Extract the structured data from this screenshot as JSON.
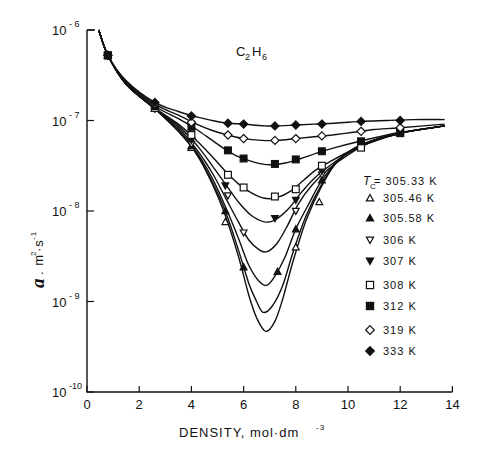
{
  "chart_data": {
    "type": "line",
    "annotation": {
      "main": "C",
      "sub1": "2",
      "mid": "H",
      "sub2": "6"
    },
    "xlabel": "DENSITY, mol·dm",
    "xlabel_exp": "-3",
    "ylabel": "a",
    "ylabel_units": ". m",
    "ylabel_units_exp": "2",
    "ylabel_units2": "·s",
    "ylabel_units2_exp": "-1",
    "xlim": [
      0,
      14
    ],
    "ylim_log10": [
      -10,
      -6
    ],
    "yscale": "log",
    "grid": false,
    "x_ticks": [
      0,
      2,
      4,
      6,
      8,
      10,
      12,
      14
    ],
    "x_tick_labels": [
      "0",
      "2",
      "4",
      "6",
      "8",
      "10",
      "12",
      "14"
    ],
    "y_ticks_log10": [
      -6,
      -7,
      -8,
      -9,
      -10
    ],
    "y_tick_labels": [
      {
        "base": "10",
        "exp": "- 6"
      },
      {
        "base": "10",
        "exp": "- 7"
      },
      {
        "base": "10",
        "exp": "- 8"
      },
      {
        "base": "10",
        "exp": "- 9"
      },
      {
        "base": "10",
        "exp": "-10"
      }
    ],
    "legend": {
      "position": "right",
      "title_sym": "T",
      "title_sub": "C",
      "title_value": " = 305.33 K"
    },
    "series": [
      {
        "name": "305.33 K",
        "marker": "none",
        "curve": [
          [
            0.45,
            -6.0
          ],
          [
            0.8,
            -6.28
          ],
          [
            1.5,
            -6.6
          ],
          [
            2.6,
            -6.87
          ],
          [
            3.5,
            -7.12
          ],
          [
            4.2,
            -7.37
          ],
          [
            4.8,
            -7.7
          ],
          [
            5.3,
            -8.05
          ],
          [
            5.8,
            -8.5
          ],
          [
            6.2,
            -8.93
          ],
          [
            6.5,
            -9.18
          ],
          [
            6.85,
            -9.33
          ],
          [
            7.2,
            -9.22
          ],
          [
            7.5,
            -8.97
          ],
          [
            7.9,
            -8.55
          ],
          [
            8.4,
            -8.1
          ],
          [
            9.0,
            -7.72
          ],
          [
            9.6,
            -7.45
          ],
          [
            10.5,
            -7.27
          ],
          [
            12.0,
            -7.14
          ],
          [
            13.7,
            -7.06
          ]
        ],
        "points": []
      },
      {
        "name": "305.46 K",
        "marker": "triangle-open",
        "curve": [
          [
            0.45,
            -6.0
          ],
          [
            0.8,
            -6.28
          ],
          [
            1.5,
            -6.6
          ],
          [
            2.6,
            -6.87
          ],
          [
            3.5,
            -7.12
          ],
          [
            4.2,
            -7.37
          ],
          [
            4.8,
            -7.68
          ],
          [
            5.3,
            -8.0
          ],
          [
            5.8,
            -8.43
          ],
          [
            6.2,
            -8.8
          ],
          [
            6.5,
            -9.0
          ],
          [
            6.75,
            -9.12
          ],
          [
            7.1,
            -9.05
          ],
          [
            7.5,
            -8.82
          ],
          [
            7.9,
            -8.45
          ],
          [
            8.4,
            -8.05
          ],
          [
            9.0,
            -7.7
          ],
          [
            9.6,
            -7.45
          ],
          [
            10.5,
            -7.27
          ],
          [
            12.0,
            -7.14
          ],
          [
            13.7,
            -7.06
          ]
        ],
        "points": [
          [
            0.8,
            -6.28
          ],
          [
            2.6,
            -6.87
          ],
          [
            4.0,
            -7.3
          ],
          [
            5.3,
            -8.12
          ],
          [
            8.0,
            -8.4
          ],
          [
            8.9,
            -7.9
          ]
        ]
      },
      {
        "name": "305.58 K",
        "marker": "triangle-filled",
        "curve": [
          [
            0.45,
            -6.0
          ],
          [
            0.8,
            -6.28
          ],
          [
            1.5,
            -6.6
          ],
          [
            2.6,
            -6.87
          ],
          [
            3.5,
            -7.1
          ],
          [
            4.2,
            -7.35
          ],
          [
            4.8,
            -7.64
          ],
          [
            5.3,
            -7.95
          ],
          [
            5.8,
            -8.3
          ],
          [
            6.2,
            -8.6
          ],
          [
            6.6,
            -8.78
          ],
          [
            6.9,
            -8.82
          ],
          [
            7.2,
            -8.72
          ],
          [
            7.6,
            -8.5
          ],
          [
            8.0,
            -8.2
          ],
          [
            8.5,
            -7.92
          ],
          [
            9.0,
            -7.66
          ],
          [
            9.6,
            -7.45
          ],
          [
            10.5,
            -7.27
          ],
          [
            12.0,
            -7.14
          ],
          [
            13.7,
            -7.06
          ]
        ],
        "points": [
          [
            0.8,
            -6.28
          ],
          [
            2.6,
            -6.87
          ],
          [
            4.0,
            -7.28
          ],
          [
            5.3,
            -8.0
          ],
          [
            6.0,
            -8.62
          ],
          [
            7.3,
            -8.67
          ],
          [
            8.0,
            -8.2
          ],
          [
            9.0,
            -7.66
          ]
        ]
      },
      {
        "name": "306 K",
        "marker": "triangle-down-open",
        "curve": [
          [
            0.45,
            -6.0
          ],
          [
            0.8,
            -6.28
          ],
          [
            1.5,
            -6.6
          ],
          [
            2.6,
            -6.87
          ],
          [
            3.5,
            -7.08
          ],
          [
            4.2,
            -7.32
          ],
          [
            4.8,
            -7.58
          ],
          [
            5.3,
            -7.85
          ],
          [
            5.8,
            -8.12
          ],
          [
            6.2,
            -8.32
          ],
          [
            6.6,
            -8.43
          ],
          [
            6.9,
            -8.45
          ],
          [
            7.3,
            -8.35
          ],
          [
            7.7,
            -8.15
          ],
          [
            8.1,
            -7.92
          ],
          [
            8.6,
            -7.72
          ],
          [
            9.2,
            -7.55
          ],
          [
            10.0,
            -7.38
          ],
          [
            10.8,
            -7.25
          ],
          [
            12.0,
            -7.14
          ],
          [
            13.7,
            -7.06
          ]
        ],
        "points": [
          [
            0.8,
            -6.28
          ],
          [
            2.6,
            -6.87
          ],
          [
            4.0,
            -7.26
          ],
          [
            5.4,
            -7.83
          ],
          [
            6.0,
            -8.24
          ],
          [
            8.0,
            -8.0
          ],
          [
            9.0,
            -7.6
          ]
        ]
      },
      {
        "name": "307 K",
        "marker": "triangle-down-filled",
        "curve": [
          [
            0.45,
            -6.0
          ],
          [
            0.8,
            -6.28
          ],
          [
            1.5,
            -6.6
          ],
          [
            2.6,
            -6.87
          ],
          [
            3.5,
            -7.06
          ],
          [
            4.2,
            -7.27
          ],
          [
            4.8,
            -7.5
          ],
          [
            5.3,
            -7.7
          ],
          [
            5.8,
            -7.9
          ],
          [
            6.3,
            -8.05
          ],
          [
            6.8,
            -8.12
          ],
          [
            7.2,
            -8.1
          ],
          [
            7.7,
            -7.98
          ],
          [
            8.2,
            -7.8
          ],
          [
            8.7,
            -7.64
          ],
          [
            9.3,
            -7.5
          ],
          [
            10.0,
            -7.36
          ],
          [
            10.8,
            -7.25
          ],
          [
            12.0,
            -7.14
          ],
          [
            13.7,
            -7.06
          ]
        ],
        "points": [
          [
            0.8,
            -6.28
          ],
          [
            2.6,
            -6.87
          ],
          [
            4.0,
            -7.22
          ],
          [
            5.3,
            -7.72
          ],
          [
            7.2,
            -8.08
          ],
          [
            8.0,
            -7.88
          ],
          [
            9.0,
            -7.56
          ]
        ]
      },
      {
        "name": "308 K",
        "marker": "square-open",
        "curve": [
          [
            0.45,
            -6.0
          ],
          [
            0.8,
            -6.28
          ],
          [
            1.5,
            -6.6
          ],
          [
            2.6,
            -6.86
          ],
          [
            3.5,
            -7.04
          ],
          [
            4.2,
            -7.22
          ],
          [
            4.8,
            -7.4
          ],
          [
            5.3,
            -7.56
          ],
          [
            5.8,
            -7.7
          ],
          [
            6.3,
            -7.8
          ],
          [
            6.8,
            -7.86
          ],
          [
            7.3,
            -7.85
          ],
          [
            7.8,
            -7.78
          ],
          [
            8.3,
            -7.66
          ],
          [
            8.8,
            -7.54
          ],
          [
            9.4,
            -7.44
          ],
          [
            10.2,
            -7.32
          ],
          [
            11.0,
            -7.22
          ],
          [
            12.0,
            -7.14
          ],
          [
            13.7,
            -7.06
          ]
        ],
        "points": [
          [
            0.8,
            -6.28
          ],
          [
            2.6,
            -6.86
          ],
          [
            4.0,
            -7.16
          ],
          [
            5.4,
            -7.6
          ],
          [
            6.0,
            -7.74
          ],
          [
            7.2,
            -7.84
          ],
          [
            8.0,
            -7.76
          ],
          [
            9.0,
            -7.5
          ],
          [
            10.5,
            -7.3
          ],
          [
            12.0,
            -7.14
          ]
        ]
      },
      {
        "name": "312 K",
        "marker": "square-filled",
        "curve": [
          [
            0.45,
            -6.0
          ],
          [
            0.8,
            -6.28
          ],
          [
            1.5,
            -6.58
          ],
          [
            2.6,
            -6.84
          ],
          [
            3.5,
            -6.98
          ],
          [
            4.2,
            -7.1
          ],
          [
            4.8,
            -7.22
          ],
          [
            5.3,
            -7.32
          ],
          [
            5.8,
            -7.4
          ],
          [
            6.4,
            -7.46
          ],
          [
            7.0,
            -7.49
          ],
          [
            7.6,
            -7.47
          ],
          [
            8.2,
            -7.42
          ],
          [
            8.8,
            -7.36
          ],
          [
            9.5,
            -7.3
          ],
          [
            10.3,
            -7.24
          ],
          [
            11.2,
            -7.18
          ],
          [
            12.0,
            -7.13
          ],
          [
            13.7,
            -7.06
          ]
        ],
        "points": [
          [
            0.8,
            -6.28
          ],
          [
            2.6,
            -6.84
          ],
          [
            4.0,
            -7.07
          ],
          [
            5.4,
            -7.33
          ],
          [
            6.0,
            -7.42
          ],
          [
            7.2,
            -7.48
          ],
          [
            8.0,
            -7.43
          ],
          [
            9.0,
            -7.34
          ],
          [
            10.5,
            -7.23
          ],
          [
            12.0,
            -7.13
          ]
        ]
      },
      {
        "name": "319 K",
        "marker": "diamond-open",
        "curve": [
          [
            0.45,
            -6.0
          ],
          [
            0.8,
            -6.28
          ],
          [
            1.5,
            -6.57
          ],
          [
            2.6,
            -6.82
          ],
          [
            3.5,
            -6.94
          ],
          [
            4.2,
            -7.04
          ],
          [
            4.8,
            -7.11
          ],
          [
            5.4,
            -7.16
          ],
          [
            6.0,
            -7.2
          ],
          [
            6.7,
            -7.22
          ],
          [
            7.3,
            -7.22
          ],
          [
            8.0,
            -7.2
          ],
          [
            8.7,
            -7.18
          ],
          [
            9.4,
            -7.16
          ],
          [
            10.2,
            -7.13
          ],
          [
            11.0,
            -7.1
          ],
          [
            12.0,
            -7.08
          ],
          [
            13.7,
            -7.04
          ]
        ],
        "points": [
          [
            0.8,
            -6.28
          ],
          [
            2.6,
            -6.82
          ],
          [
            4.0,
            -7.02
          ],
          [
            5.4,
            -7.16
          ],
          [
            6.0,
            -7.2
          ],
          [
            7.2,
            -7.22
          ],
          [
            8.0,
            -7.2
          ],
          [
            9.0,
            -7.17
          ],
          [
            10.5,
            -7.12
          ],
          [
            12.0,
            -7.08
          ]
        ]
      },
      {
        "name": "333 K",
        "marker": "diamond-filled",
        "curve": [
          [
            0.45,
            -6.0
          ],
          [
            0.8,
            -6.28
          ],
          [
            1.5,
            -6.56
          ],
          [
            2.6,
            -6.8
          ],
          [
            3.5,
            -6.9
          ],
          [
            4.2,
            -6.96
          ],
          [
            4.8,
            -7.0
          ],
          [
            5.4,
            -7.03
          ],
          [
            6.0,
            -7.04
          ],
          [
            6.8,
            -7.06
          ],
          [
            7.4,
            -7.06
          ],
          [
            8.0,
            -7.05
          ],
          [
            8.7,
            -7.04
          ],
          [
            9.5,
            -7.03
          ],
          [
            10.5,
            -7.01
          ],
          [
            11.5,
            -7.0
          ],
          [
            12.5,
            -6.99
          ],
          [
            13.7,
            -6.99
          ]
        ],
        "points": [
          [
            0.8,
            -6.28
          ],
          [
            2.6,
            -6.8
          ],
          [
            4.0,
            -6.95
          ],
          [
            5.4,
            -7.03
          ],
          [
            6.0,
            -7.04
          ],
          [
            7.2,
            -7.06
          ],
          [
            8.0,
            -7.05
          ],
          [
            9.0,
            -7.04
          ],
          [
            10.5,
            -7.01
          ],
          [
            12.0,
            -7.0
          ]
        ]
      }
    ]
  }
}
